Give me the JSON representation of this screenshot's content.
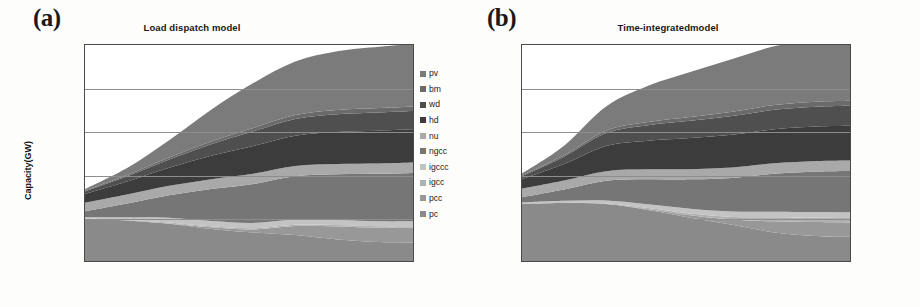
{
  "figure": {
    "panels": [
      {
        "letter": "(a)",
        "title": "Load dispatch model",
        "ylabel": "Capacity(GW)"
      },
      {
        "letter": "(b)",
        "title": "Time-integratedmodel",
        "ylabel": "Capacity (GW)"
      }
    ],
    "legend_labels": [
      "pv",
      "bm",
      "wd",
      "hd",
      "nu",
      "ngcc",
      "igccc",
      "igcc",
      "pcc",
      "pc"
    ],
    "legend_colors": [
      "#7b7b7b",
      "#6a6a6a",
      "#4f4f4f",
      "#3c3c3c",
      "#a9a9a9",
      "#767676",
      "#c3c3c3",
      "#b0b0b0",
      "#989898",
      "#8a8a8a"
    ]
  },
  "chart_data": [
    {
      "type": "area",
      "title": "Load dispatch model",
      "xlabel": "",
      "ylabel": "Capacity(GW)",
      "stacked": true,
      "grid": true,
      "legend_position": "right",
      "xlim": [
        2011,
        2050
      ],
      "ylim": [
        0,
        2500
      ],
      "yticks": [
        0,
        500,
        1000,
        1500,
        2000,
        2500
      ],
      "xticks": [
        2011,
        2016,
        2021,
        2026,
        2031,
        2036,
        2041,
        2046
      ],
      "x": [
        2011,
        2016,
        2021,
        2026,
        2031,
        2036,
        2041,
        2046,
        2050
      ],
      "stack_order_bottom_to_top": [
        "pc",
        "pcc",
        "igcc",
        "igccc",
        "ngcc",
        "nu",
        "hd",
        "wd",
        "bm",
        "pv"
      ],
      "series": [
        {
          "name": "pc",
          "color": "#8a8a8a",
          "values": [
            490,
            470,
            430,
            370,
            330,
            300,
            250,
            220,
            215
          ]
        },
        {
          "name": "pcc",
          "color": "#989898",
          "values": [
            0,
            0,
            5,
            20,
            35,
            105,
            150,
            165,
            170
          ]
        },
        {
          "name": "igcc",
          "color": "#b0b0b0",
          "values": [
            0,
            5,
            10,
            12,
            14,
            15,
            16,
            16,
            16
          ]
        },
        {
          "name": "igccc",
          "color": "#c3c3c3",
          "values": [
            15,
            30,
            55,
            60,
            62,
            60,
            58,
            58,
            58
          ]
        },
        {
          "name": "ngcc",
          "color": "#767676",
          "values": [
            70,
            160,
            260,
            370,
            450,
            500,
            530,
            550,
            560
          ]
        },
        {
          "name": "nu",
          "color": "#a9a9a9",
          "values": [
            100,
            105,
            110,
            115,
            120,
            120,
            120,
            120,
            120
          ]
        },
        {
          "name": "hd",
          "color": "#3c3c3c",
          "values": [
            100,
            150,
            210,
            270,
            320,
            350,
            370,
            380,
            385
          ]
        },
        {
          "name": "wd",
          "color": "#4f4f4f",
          "values": [
            30,
            60,
            95,
            135,
            170,
            195,
            205,
            210,
            212
          ]
        },
        {
          "name": "bm",
          "color": "#6a6a6a",
          "values": [
            10,
            15,
            22,
            30,
            38,
            45,
            50,
            52,
            53
          ]
        },
        {
          "name": "pv",
          "color": "#7b7b7b",
          "values": [
            15,
            80,
            200,
            370,
            520,
            620,
            680,
            710,
            720
          ]
        }
      ],
      "totals": [
        830,
        1075,
        1397,
        1752,
        2059,
        2310,
        2429,
        2481,
        2509
      ]
    },
    {
      "type": "area",
      "title": "Time-integratedmodel",
      "xlabel": "",
      "ylabel": "Capacity (GW)",
      "stacked": true,
      "grid": true,
      "legend_position": "right",
      "xlim": [
        2011,
        2050
      ],
      "ylim": [
        0,
        2500
      ],
      "yticks": [
        0,
        500,
        1000,
        1500,
        2000,
        2500
      ],
      "xticks": [
        2011,
        2016,
        2021,
        2026,
        2031,
        2036,
        2041,
        2046
      ],
      "x": [
        2011,
        2016,
        2021,
        2026,
        2031,
        2036,
        2041,
        2046,
        2050
      ],
      "stack_order_bottom_to_top": [
        "pc",
        "pcc",
        "igcc",
        "igccc",
        "ngcc",
        "nu",
        "hd",
        "wd",
        "bm",
        "pv"
      ],
      "series": [
        {
          "name": "pc",
          "color": "#8a8a8a",
          "values": [
            660,
            670,
            660,
            590,
            500,
            420,
            330,
            290,
            280
          ]
        },
        {
          "name": "pcc",
          "color": "#989898",
          "values": [
            0,
            0,
            0,
            10,
            30,
            60,
            130,
            160,
            165
          ]
        },
        {
          "name": "igcc",
          "color": "#b0b0b0",
          "values": [
            0,
            2,
            5,
            12,
            20,
            30,
            45,
            50,
            52
          ]
        },
        {
          "name": "igccc",
          "color": "#c3c3c3",
          "values": [
            18,
            25,
            35,
            45,
            55,
            62,
            65,
            66,
            66
          ]
        },
        {
          "name": "ngcc",
          "color": "#767676",
          "values": [
            60,
            130,
            230,
            290,
            340,
            390,
            440,
            470,
            480
          ]
        },
        {
          "name": "nu",
          "color": "#a9a9a9",
          "values": [
            100,
            105,
            110,
            115,
            118,
            120,
            120,
            120,
            120
          ]
        },
        {
          "name": "hd",
          "color": "#3c3c3c",
          "values": [
            110,
            190,
            290,
            330,
            360,
            380,
            395,
            400,
            402
          ]
        },
        {
          "name": "wd",
          "color": "#4f4f4f",
          "values": [
            35,
            85,
            150,
            180,
            200,
            215,
            225,
            230,
            232
          ]
        },
        {
          "name": "bm",
          "color": "#6a6a6a",
          "values": [
            10,
            18,
            28,
            36,
            44,
            50,
            55,
            57,
            58
          ]
        },
        {
          "name": "pv",
          "color": "#7b7b7b",
          "values": [
            20,
            110,
            280,
            420,
            520,
            610,
            680,
            710,
            720
          ]
        }
      ],
      "totals": [
        1013,
        1335,
        1788,
        2028,
        2187,
        2337,
        2485,
        2553,
        2575
      ]
    }
  ]
}
